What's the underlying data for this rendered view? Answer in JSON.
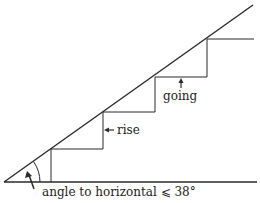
{
  "diagram": {
    "labels": {
      "going": "going",
      "rise": "rise",
      "angle": "angle to horizontal ⩽ 38°"
    },
    "colors": {
      "line": "#2a2a2a",
      "background": "#ffffff"
    }
  }
}
